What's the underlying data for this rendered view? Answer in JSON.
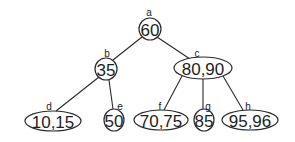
{
  "diagram": {
    "type": "tree",
    "nodes": [
      {
        "id": "a",
        "label": "a",
        "value": "60",
        "cx": 150,
        "cy": 29,
        "rx": 11,
        "ry": 11,
        "lx": 149,
        "ly": 12
      },
      {
        "id": "b",
        "label": "b",
        "value": "35",
        "cx": 106,
        "cy": 69,
        "rx": 11,
        "ry": 11,
        "lx": 107,
        "ly": 53
      },
      {
        "id": "c",
        "label": "c",
        "value": "80,90",
        "cx": 203,
        "cy": 68,
        "rx": 29,
        "ry": 11,
        "lx": 197,
        "ly": 53
      },
      {
        "id": "d",
        "label": "d",
        "value": "10,15",
        "cx": 53,
        "cy": 121,
        "rx": 28,
        "ry": 10,
        "lx": 49,
        "ly": 106
      },
      {
        "id": "e",
        "label": "e",
        "value": "50",
        "cx": 114,
        "cy": 120,
        "rx": 10,
        "ry": 11,
        "lx": 120,
        "ly": 106
      },
      {
        "id": "f",
        "label": "f",
        "value": "70,75",
        "cx": 161,
        "cy": 120,
        "rx": 27,
        "ry": 10,
        "lx": 160,
        "ly": 106
      },
      {
        "id": "g",
        "label": "g",
        "value": "85",
        "cx": 204,
        "cy": 120,
        "rx": 10,
        "ry": 11,
        "lx": 208,
        "ly": 106
      },
      {
        "id": "h",
        "label": "h",
        "value": "95,96",
        "cx": 250,
        "cy": 120,
        "rx": 28,
        "ry": 10,
        "lx": 248,
        "ly": 106
      }
    ],
    "edges": [
      {
        "from": "a",
        "to": "b",
        "x1": 142,
        "y1": 37,
        "x2": 113,
        "y2": 60
      },
      {
        "from": "a",
        "to": "c",
        "x1": 157,
        "y1": 37,
        "x2": 190,
        "y2": 59
      },
      {
        "from": "b",
        "to": "d",
        "x1": 99,
        "y1": 77,
        "x2": 56,
        "y2": 111
      },
      {
        "from": "b",
        "to": "e",
        "x1": 109,
        "y1": 80,
        "x2": 113,
        "y2": 109
      },
      {
        "from": "c",
        "to": "f",
        "x1": 182,
        "y1": 76,
        "x2": 164,
        "y2": 110
      },
      {
        "from": "c",
        "to": "g",
        "x1": 203,
        "y1": 79,
        "x2": 203,
        "y2": 109
      },
      {
        "from": "c",
        "to": "h",
        "x1": 223,
        "y1": 76,
        "x2": 243,
        "y2": 110
      }
    ]
  }
}
